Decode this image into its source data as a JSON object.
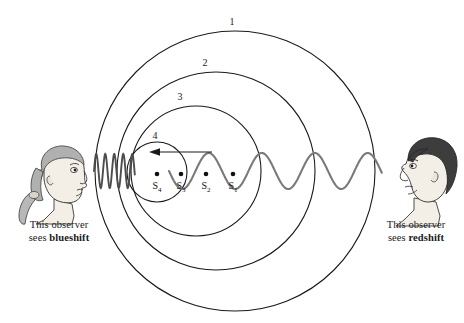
{
  "figure": {
    "name": "doppler-effect-diagram",
    "background_color": "#ffffff"
  },
  "observers": {
    "left": {
      "name": "blueshift-observer",
      "gender_depiction": "woman with ponytail facing right",
      "caption_line1": "This observer",
      "caption_line2_prefix": "sees ",
      "caption_line2_emph": "blueshift",
      "position": {
        "x": 14,
        "y": 148
      }
    },
    "right": {
      "name": "redshift-observer",
      "gender_depiction": "man with dark hair facing left",
      "caption_line1": "This observer",
      "caption_line2_prefix": "sees ",
      "caption_line2_emph": "redshift",
      "position": {
        "x": 386,
        "y": 136
      }
    }
  },
  "wavefronts": [
    {
      "label": "1",
      "cx": 235,
      "cy": 171,
      "r": 140,
      "label_x": 232,
      "label_y": 25
    },
    {
      "label": "2",
      "cx": 216,
      "cy": 171,
      "r": 99,
      "label_x": 205,
      "label_y": 66
    },
    {
      "label": "3",
      "cx": 196,
      "cy": 171,
      "r": 65,
      "label_x": 180,
      "label_y": 100
    },
    {
      "label": "4",
      "cx": 157,
      "cy": 172,
      "r": 30,
      "label_x": 155,
      "label_y": 139
    }
  ],
  "sources": [
    {
      "label": "S",
      "sub": "4",
      "x": 157,
      "y": 174,
      "label_x": 157,
      "label_y": 189
    },
    {
      "label": "S",
      "sub": "3",
      "x": 181,
      "y": 174,
      "label_x": 181,
      "label_y": 189
    },
    {
      "label": "S",
      "sub": "2",
      "x": 206,
      "y": 174,
      "label_x": 206,
      "label_y": 189
    },
    {
      "label": "S",
      "sub": "1",
      "x": 233,
      "y": 174,
      "label_x": 233,
      "label_y": 189
    }
  ],
  "motion_arrow": {
    "name": "source-motion-arrow",
    "direction": "left",
    "x_start": 212,
    "x_end": 151,
    "y": 152
  },
  "waves": {
    "blueshift_wave": {
      "name": "compressed-wave-left",
      "description": "compressed short-wavelength wave toward left observer",
      "x_start": 94,
      "x_end": 135,
      "wavelength": 9,
      "amplitude": 17,
      "color": "#4d4d4d"
    },
    "redshift_wave": {
      "name": "stretched-wave-right",
      "description": "stretched long-wavelength wave toward right observer",
      "x_start": 169,
      "x_end": 382,
      "wavelength": 53,
      "amplitude": 18,
      "color": "#7a7a7a"
    }
  },
  "colors": {
    "circle_stroke": "#1a1a1a",
    "text": "#1a1a1a",
    "skin_fill": "#f2ede4",
    "hair_left": "#a8a8a8",
    "hair_right": "#3d3d3d",
    "outline": "#2b2b2b"
  }
}
